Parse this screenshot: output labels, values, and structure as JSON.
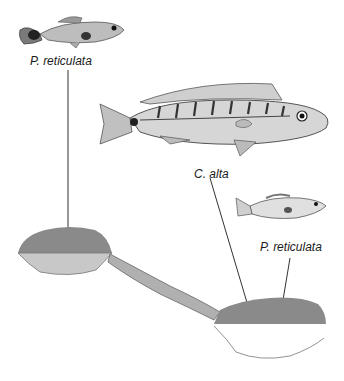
{
  "labels": {
    "upstream_fish": "P. reticulata",
    "predator_fish": "C. alta",
    "downstream_fish": "P. reticulata"
  },
  "colors": {
    "pool_water": "#8a8a8a",
    "upstream_pool_floor": "#c8c8c8",
    "downstream_pool_floor": "#ffffff",
    "rapids": "#b0b0b0",
    "leader_line": "#333333",
    "text": "#1a1a1a"
  }
}
